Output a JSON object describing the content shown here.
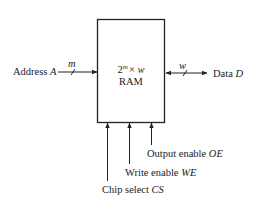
{
  "diagram": {
    "block": {
      "size_base": "2",
      "size_exp": "m",
      "size_times": "× ",
      "size_width": "w",
      "name": "RAM"
    },
    "inputs": {
      "address": {
        "label": "Address ",
        "symbol": "A",
        "bus_width": "m"
      },
      "data": {
        "label": "Data ",
        "symbol": "D",
        "bus_width": "w"
      },
      "chip_select": {
        "label": "Chip select ",
        "symbol": "CS"
      },
      "write_enable": {
        "label": "Write enable ",
        "symbol": "WE"
      },
      "output_enable": {
        "label": "Output enable ",
        "symbol": "OE"
      }
    },
    "colors": {
      "line": "#222222",
      "background": "#ffffff"
    }
  }
}
